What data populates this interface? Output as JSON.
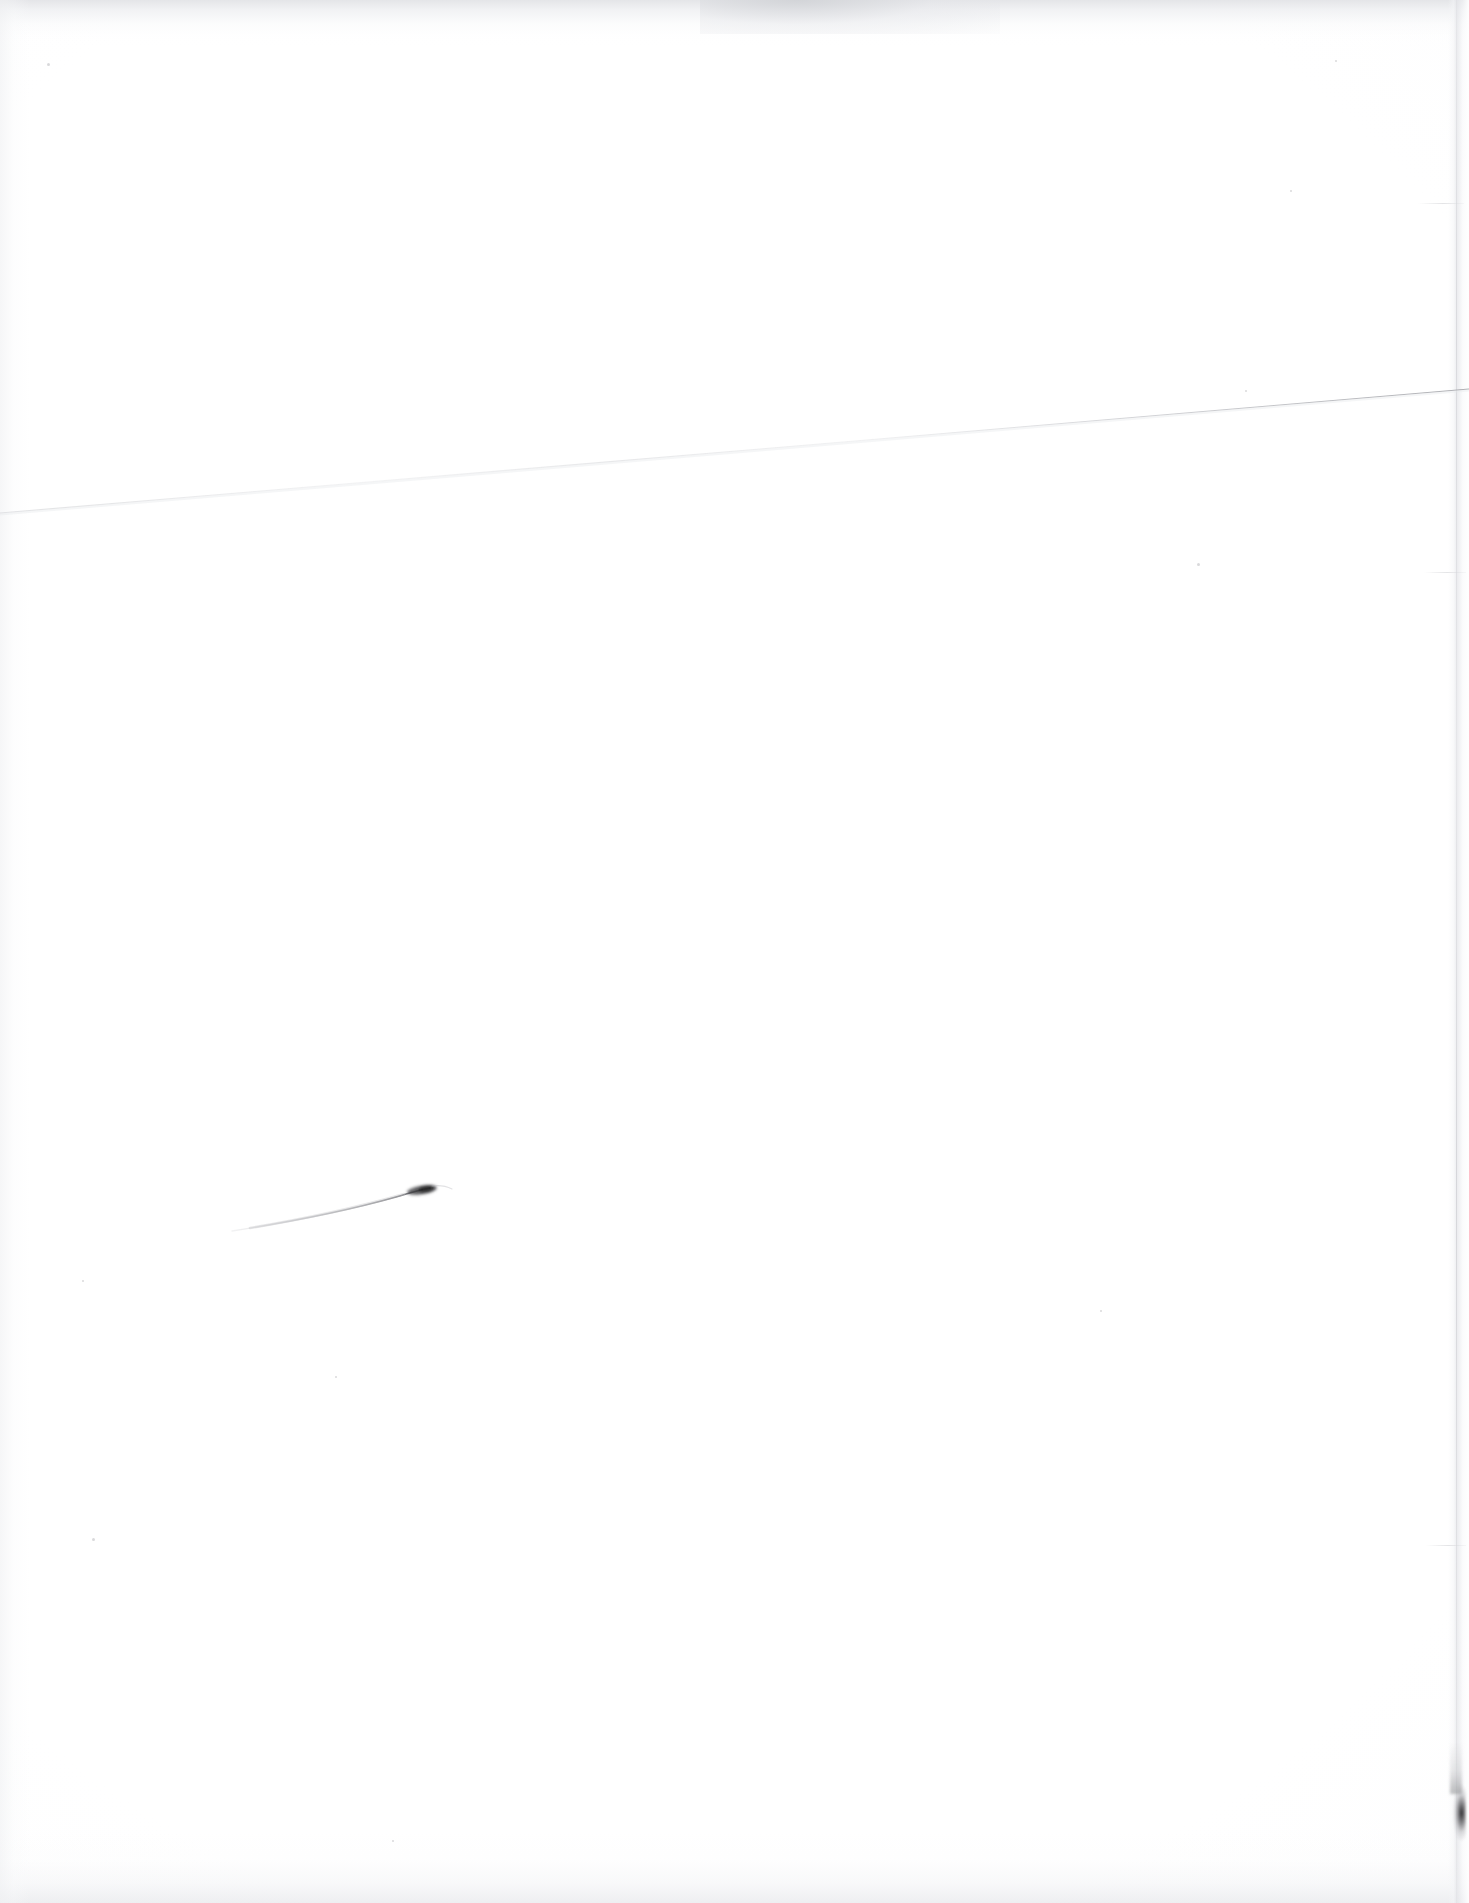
{
  "document": {
    "kind": "scanned-page",
    "page_label": "",
    "visible_text": "",
    "body_text": "",
    "description_label": "",
    "note": ""
  },
  "canvas": {
    "width_px": 1469,
    "height_px": 1903,
    "background_color": "#ffffff",
    "paper_color": "#fdfdfe"
  },
  "marks": {
    "diagonal_rule": {
      "name": "diagonal-hairline",
      "label": "",
      "color": "#c9cacd",
      "x1_px": 0,
      "y1_px": 513,
      "x2_px": 1469,
      "y2_px": 389,
      "stroke_width_px": 1.1
    },
    "pen_flick": {
      "name": "pen-flick-stroke",
      "label": "",
      "color": "#9a9b9f",
      "x1_px": 232,
      "y1_px": 1231,
      "x2_px": 434,
      "y2_px": 1187,
      "stroke_width_px": 1.4,
      "blob": {
        "name": "ink-blob",
        "color": "#3b3b3e",
        "cx_px": 424,
        "cy_px": 1190,
        "rx_px": 15,
        "ry_px": 4
      }
    },
    "edge_smudge": {
      "name": "right-edge-smudge",
      "label": "",
      "color": "#1c1c1e",
      "x_px": 1452,
      "y_px": 1784,
      "width_px": 14,
      "height_px": 58
    },
    "specks": [
      {
        "name": "speck-upper-left",
        "x_px": 47,
        "y_px": 63,
        "d_px": 3
      },
      {
        "name": "speck-mid-left",
        "x_px": 92,
        "y_px": 1538,
        "d_px": 3
      },
      {
        "name": "speck-mid-center",
        "x_px": 335,
        "y_px": 1376,
        "d_px": 2
      },
      {
        "name": "speck-upper-right",
        "x_px": 1335,
        "y_px": 60,
        "d_px": 2
      },
      {
        "name": "speck-center-right",
        "x_px": 1290,
        "y_px": 190,
        "d_px": 2
      },
      {
        "name": "speck-right-mid",
        "x_px": 1197,
        "y_px": 563,
        "d_px": 3
      },
      {
        "name": "speck-lower-left",
        "x_px": 82,
        "y_px": 1280,
        "d_px": 2
      },
      {
        "name": "speck-low-center",
        "x_px": 392,
        "y_px": 1840,
        "d_px": 2
      },
      {
        "name": "speck-low-right",
        "x_px": 1100,
        "y_px": 1310,
        "d_px": 2
      },
      {
        "name": "speck-top-right",
        "x_px": 1245,
        "y_px": 390,
        "d_px": 2
      }
    ],
    "edge_scuffs": [
      {
        "name": "edge-scuff-upper",
        "x_px": 1418,
        "y_px": 203,
        "width_px": 46
      },
      {
        "name": "edge-scuff-mid",
        "x_px": 1424,
        "y_px": 572,
        "width_px": 42
      },
      {
        "name": "edge-scuff-lower",
        "x_px": 1426,
        "y_px": 1545,
        "width_px": 40
      }
    ]
  },
  "scan_artifacts": {
    "top_haze": {
      "name": "scan-haze-top",
      "color": "#e2e3e6",
      "height_px": 46
    },
    "bottom_haze": {
      "name": "scan-haze-bottom",
      "color": "#e9eaed",
      "height_px": 72
    },
    "left_haze": {
      "name": "scan-haze-left",
      "color": "#f0f1f3",
      "width_px": 30
    },
    "right_paper_edge": {
      "name": "paper-right-edge",
      "color": "#e4e5e9",
      "x_px": 1448
    }
  }
}
